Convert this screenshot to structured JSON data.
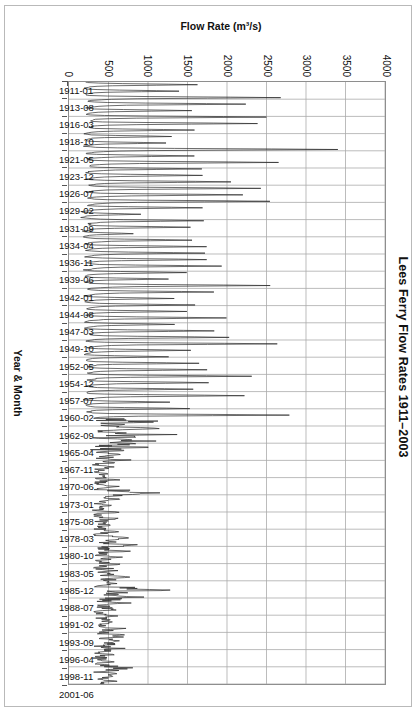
{
  "figure": {
    "title": "Lees Ferry Flow Rates 1911–2003",
    "background_color": "#ffffff",
    "frame_color": "#b9b9b9"
  },
  "chart_data": {
    "type": "line",
    "title": "Lees Ferry Flow Rates 1911–2003",
    "xlabel": "Year & Month",
    "ylabel": "Flow Rate (m³/s)",
    "orientation": "rotated-90-landscape-in-portrait",
    "grid": true,
    "grid_color": "#aaaaaa",
    "legend": "none",
    "line_color": "#2b2b2b",
    "line_width": 0.7,
    "ylim": [
      0,
      4000
    ],
    "ytick_labels": [
      "0",
      "500",
      "1000",
      "1500",
      "2000",
      "2500",
      "3000",
      "3500",
      "4000"
    ],
    "ytick_values": [
      0,
      500,
      1000,
      1500,
      2000,
      2500,
      3000,
      3500,
      4000
    ],
    "xlim_labels": [
      "1911-01",
      "2003-12"
    ],
    "xtick_labels": [
      "1911-01",
      "1913-08",
      "1916-03",
      "1918-10",
      "1921-05",
      "1923-12",
      "1926-07",
      "1929-02",
      "1931-09",
      "1934-04",
      "1936-11",
      "1939-06",
      "1942-01",
      "1944-08",
      "1947-03",
      "1949-10",
      "1952-05",
      "1954-12",
      "1957-07",
      "1960-02",
      "1962-09",
      "1965-04",
      "1967-11",
      "1970-06",
      "1973-01",
      "1975-08",
      "1978-03",
      "1980-10",
      "1983-05",
      "1985-12",
      "1988-07",
      "1991-02",
      "1993-09",
      "1996-04",
      "1998-11",
      "2001-06"
    ],
    "x_start_year": 1911,
    "x_start_month": 1,
    "n_points": 1116,
    "series": [
      {
        "name": "Lees Ferry monthly mean flow",
        "units": "m^3/s",
        "annual_peak_month_index": 5,
        "annual_peaks": [
          1600,
          1410,
          2650,
          2250,
          1520,
          2530,
          2400,
          1560,
          1300,
          1240,
          3400,
          1560,
          2620,
          1700,
          1730,
          2050,
          2400,
          2200,
          2560,
          1700,
          900,
          1700,
          1520,
          810,
          1560,
          1720,
          1700,
          1780,
          1900,
          1480,
          1280,
          2530,
          1820,
          1300,
          1580,
          1460,
          1980,
          1340,
          1840,
          2060,
          2600,
          1560,
          1240,
          1620,
          1720,
          2320,
          1800,
          1600,
          2240,
          1250,
          1560,
          2780,
          1320,
          1450,
          1520,
          1420,
          1280,
          780,
          940,
          700,
          620,
          680,
          700,
          1240,
          720,
          640,
          700,
          760,
          660,
          700,
          900,
          1020,
          830,
          780,
          700,
          860,
          920,
          760,
          1400,
          1180,
          900,
          740,
          700,
          720,
          880,
          960,
          820,
          780,
          700,
          660,
          980,
          760,
          700
        ],
        "annual_baseflow": [
          210,
          200,
          240,
          250,
          220,
          240,
          250,
          220,
          190,
          190,
          260,
          220,
          250,
          230,
          230,
          240,
          250,
          240,
          250,
          230,
          170,
          230,
          220,
          160,
          220,
          230,
          230,
          230,
          240,
          215,
          200,
          250,
          235,
          200,
          225,
          215,
          240,
          205,
          235,
          245,
          255,
          220,
          195,
          225,
          230,
          250,
          235,
          225,
          245,
          195,
          220,
          260,
          205,
          215,
          220,
          215,
          205,
          330,
          340,
          300,
          290,
          300,
          300,
          330,
          300,
          290,
          300,
          310,
          295,
          300,
          330,
          340,
          320,
          310,
          300,
          320,
          330,
          310,
          360,
          350,
          330,
          305,
          300,
          305,
          325,
          335,
          315,
          310,
          300,
          295,
          335,
          310,
          300
        ],
        "notes": [
          "Pre-1963 (pre Glen Canyon Dam): large sharp annual snowmelt peaks, commonly 1200-2700 m3/s, maximum about 3400 m3/s near 1921.",
          "Post-1963 (post dam): regulated flows, much lower and smoother, mostly 300-900 m3/s with a notable release peak near 1983-1984 of about 1400 m3/s."
        ]
      }
    ]
  }
}
